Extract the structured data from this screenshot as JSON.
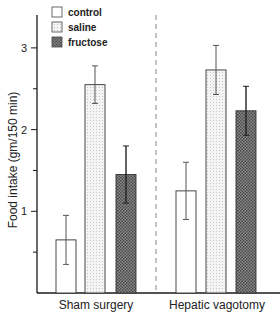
{
  "chart_data": {
    "type": "bar",
    "title": "",
    "xlabel": "",
    "ylabel": "Food intake (gm/150 min)",
    "ylim": [
      0,
      3.4
    ],
    "yticks": [
      1,
      2,
      3
    ],
    "yminor_ticks": [
      0.5,
      1.5,
      2.5
    ],
    "grid": false,
    "legend_position": "top-left",
    "categories": [
      "Sham surgery",
      "Hepatic vagotomy"
    ],
    "series": [
      {
        "name": "control",
        "fill": "white",
        "values": [
          0.65,
          1.25
        ],
        "errors": [
          0.3,
          0.35
        ]
      },
      {
        "name": "saline",
        "fill": "light-stipple",
        "values": [
          2.55,
          2.73
        ],
        "errors": [
          0.23,
          0.3
        ]
      },
      {
        "name": "fructose",
        "fill": "dark-crosshatch",
        "values": [
          1.45,
          2.23
        ],
        "errors": [
          0.35,
          0.3
        ]
      }
    ],
    "annotations": [
      "dashed vertical separator between groups"
    ]
  },
  "legend": {
    "items": [
      {
        "label": "control"
      },
      {
        "label": "saline"
      },
      {
        "label": "fructose"
      }
    ]
  },
  "axis": {
    "ylabel": "Food intake (gm/150 min)",
    "ticks": [
      "1",
      "2",
      "3"
    ]
  },
  "groups": {
    "labels": [
      "Sham surgery",
      "Hepatic vagotomy"
    ]
  },
  "colors": {
    "axis": "#1a1a1a",
    "control_fill": "#ffffff",
    "saline_fill": "#f1f1f1",
    "fructose_fill": "#6e6e6e",
    "errorbar": "#555555"
  }
}
